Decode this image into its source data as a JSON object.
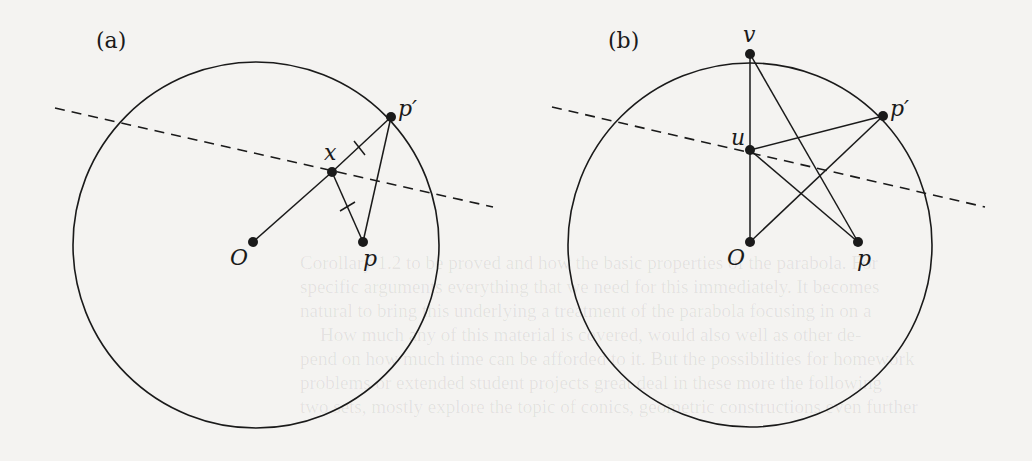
{
  "panels": [
    {
      "id": "a",
      "label": "(a)",
      "points": {
        "O": "O",
        "p": "p",
        "x": "x",
        "p_prime": "p′"
      }
    },
    {
      "id": "b",
      "label": "(b)",
      "points": {
        "v": "v",
        "u": "u",
        "p_prime": "p′",
        "O": "O",
        "p": "p"
      }
    }
  ],
  "bleed_text": [
    "Corollary 1.2 to be proved and how the basic properties of the parabola. For",
    "specific arguments everything that we need for this immediately. It becomes",
    "natural to bring this underlying a treatment of the parabola focusing in on a",
    "How much any of this material is covered, would also well as other de-",
    "pend on how much time can be afforded to it. But the possibilities for homework",
    "problems or extended student projects great deal in these more the following",
    "two sets, mostly explore the topic of conics, geometric constructions even further"
  ],
  "colors": {
    "ink": "#1a1a1a",
    "paper": "#f4f3f1"
  }
}
